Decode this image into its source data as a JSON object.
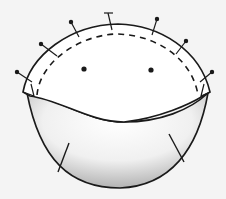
{
  "diagram": {
    "title": "Pinned dome with stitching line",
    "background": "#f4f4f4",
    "outline_color": "#1a1a1a",
    "shade_color": "#bdbdbd",
    "components": [
      {
        "id": "dome",
        "label": "top dome piece"
      },
      {
        "id": "stitch-line",
        "label": "dashed stitching line"
      },
      {
        "id": "pins",
        "label": "pins",
        "count": 8
      },
      {
        "id": "eyes",
        "label": "eye marks",
        "count": 2
      },
      {
        "id": "bowl",
        "label": "lower shaded bowl piece"
      },
      {
        "id": "darts",
        "label": "dart lines",
        "count": 2
      }
    ]
  }
}
